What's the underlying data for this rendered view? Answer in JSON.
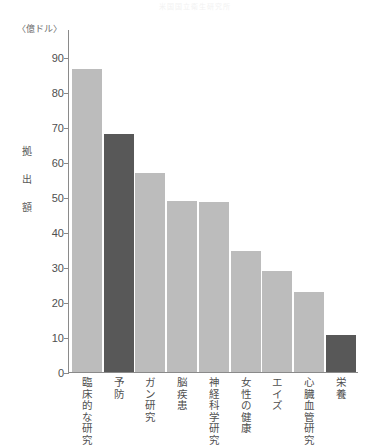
{
  "chart_data": {
    "type": "bar",
    "title": "米国国立衛生研究所",
    "unit_label": "〈億ドル〉",
    "ylabel": "拠出額",
    "xlabel": "",
    "ylim": [
      0,
      90
    ],
    "ytick_step": 10,
    "yticks": [
      0,
      10,
      20,
      30,
      40,
      50,
      60,
      70,
      80,
      90
    ],
    "grid": false,
    "legend": "none",
    "categories": [
      "臨床的な研究",
      "予防",
      "ガン研究",
      "脳疾患",
      "神経科学研究",
      "女性の健康",
      "エイズ",
      "心臓血管研究",
      "栄養"
    ],
    "values": [
      86.5,
      68,
      57,
      49,
      48.5,
      34.5,
      29,
      23,
      10.7
    ],
    "bar_colors": [
      "#bcbcbc",
      "#585858",
      "#bcbcbc",
      "#bcbcbc",
      "#bcbcbc",
      "#bcbcbc",
      "#bcbcbc",
      "#bcbcbc",
      "#585858"
    ],
    "colors": {
      "bar_default": "#bcbcbc",
      "bar_highlight": "#585858",
      "axis": "#8a8a8a",
      "text": "#4f4f4f",
      "background": "#ffffff"
    }
  }
}
